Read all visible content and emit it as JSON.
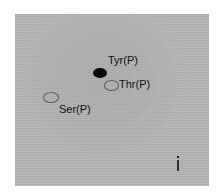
{
  "figure": {
    "panel_label": "i",
    "spots": [
      {
        "name": "Tyr(P)",
        "label": "Tyr(P)",
        "style": "filled",
        "color": "#0a0a0a"
      },
      {
        "name": "Thr(P)",
        "label": "Thr(P)",
        "style": "outline",
        "color": "#5a5a5a"
      },
      {
        "name": "Ser(P)",
        "label": "Ser(P)",
        "style": "outline",
        "color": "#5a5a5a"
      }
    ],
    "background_color": "#b4b4b4"
  }
}
